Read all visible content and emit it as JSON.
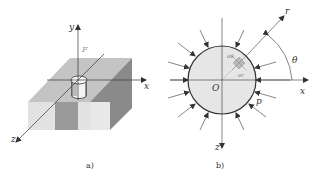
{
  "figure_a": {
    "caption": "a)",
    "axis_labels": {
      "x": "x",
      "y": "y",
      "z": "z"
    },
    "force_label": "F",
    "description": "Infinite plate/slab with cylindrical insert at origin, loaded by force F along y"
  },
  "figure_b": {
    "caption": "b)",
    "axis_labels": {
      "x": "x",
      "z": "z",
      "r": "r"
    },
    "origin_label": "O",
    "angle_label": "θ",
    "pressure_label": "p",
    "stress_labels": {
      "theta": "σθ",
      "radial": "σr"
    },
    "description": "Circular cross-section under uniform radial pressure p with polar coordinates (r, θ)"
  },
  "colors": {
    "line": "#333333",
    "face_top": "#c8c8c8",
    "face_front": "#e4e4e4",
    "face_side": "#8c8c8c",
    "circle_fill": "#e6e6e6"
  }
}
